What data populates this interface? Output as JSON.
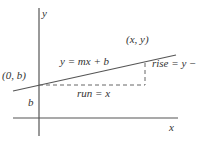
{
  "diagram": {
    "colors": {
      "axis": "#555555",
      "line": "#555555",
      "dashed": "#666666",
      "text": "#333333",
      "background": "#ffffff"
    },
    "axes": {
      "x_label": "x",
      "y_label": "y"
    },
    "line": {
      "equation": "y = mx + b"
    },
    "points": {
      "intercept": "(0, b)",
      "general": "(x, y)"
    },
    "annotations": {
      "rise": "rise = y − b",
      "run": "run = x",
      "intercept_height": "b"
    }
  }
}
